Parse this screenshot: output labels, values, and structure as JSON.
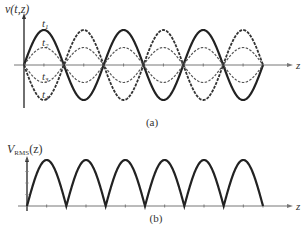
{
  "chart_data": [
    {
      "type": "line",
      "panel_label": "(a)",
      "ylabel": "v(t,z)",
      "xlabel": "z",
      "description": "Standing wave v(t,z) at four time instants",
      "x_nodes_count": 7,
      "x_range_half_wavelengths": [
        0,
        6
      ],
      "ylim": [
        -1,
        1
      ],
      "series": [
        {
          "name": "t1",
          "amplitude": 1.0,
          "style": "solid-thick"
        },
        {
          "name": "t2",
          "amplitude": 0.5,
          "style": "dashed"
        },
        {
          "name": "t3",
          "amplitude": -0.5,
          "style": "dashed"
        },
        {
          "name": "t4",
          "amplitude": -1.0,
          "style": "dashed-thick"
        }
      ],
      "grid": false
    },
    {
      "type": "line",
      "panel_label": "(b)",
      "ylabel_main": "V",
      "ylabel_sub": "RMS",
      "ylabel_tail": "(z)",
      "xlabel": "z",
      "description": "RMS voltage |sin| envelope along z",
      "x_range_half_wavelengths": [
        0,
        6
      ],
      "series": [
        {
          "name": "VRMS(z)",
          "function": "abs(sin(k z))",
          "amplitude": 1.0
        }
      ],
      "grid": false
    }
  ]
}
